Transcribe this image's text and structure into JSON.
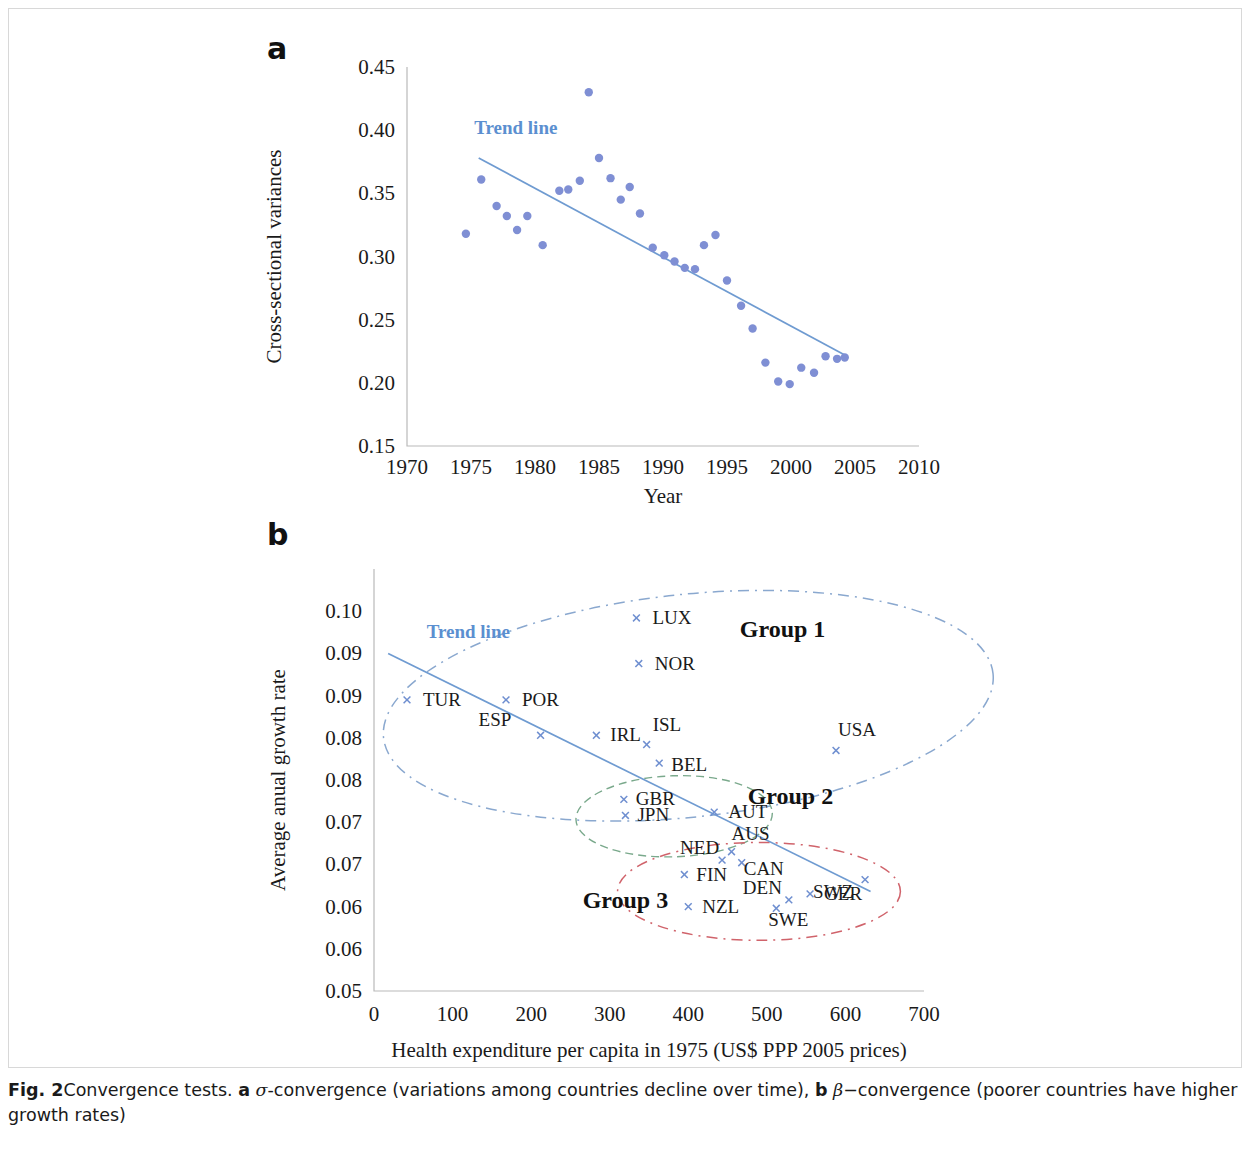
{
  "figure": {
    "panel_a_letter": "a",
    "panel_b_letter": "b",
    "caption_prefix": "Fig. 2",
    "caption_part1": "Convergence tests. ",
    "caption_a_letter": "a",
    "caption_sigma": "σ",
    "caption_part2": "-convergence (variations among countries decline over time), ",
    "caption_b_letter": "b",
    "caption_beta": "β",
    "caption_part3": "−convergence (poorer countries have higher growth rates)"
  },
  "colors": {
    "marker_blue": "#7f8fd4",
    "trend_blue": "#6f9bd1",
    "trend_label_blue": "#5b8fd0",
    "group1_ellipse": "#8aa8cf",
    "group2_ellipse": "#7aa98c",
    "group3_ellipse": "#d0636b",
    "axis_gray": "#b9b9b9"
  },
  "chart_data": [
    {
      "id": "panel_a",
      "type": "scatter",
      "title": "",
      "xlabel": "Year",
      "ylabel": "Cross-sectional variances",
      "xlim": [
        1970,
        2010
      ],
      "ylim": [
        0.15,
        0.45
      ],
      "xticks": [
        1970,
        1975,
        1980,
        1985,
        1990,
        1995,
        2000,
        2005,
        2010
      ],
      "xtick_labels": [
        "1970",
        "1975",
        "1980",
        "1985",
        "1990",
        "1995",
        "2000",
        "2005",
        "2010"
      ],
      "yticks": [
        0.15,
        0.2,
        0.25,
        0.3,
        0.35,
        0.4,
        0.45
      ],
      "ytick_labels": [
        "0.15",
        "0.20",
        "0.25",
        "0.30",
        "0.35",
        "0.40",
        "0.45"
      ],
      "grid": false,
      "legend": "none",
      "trend_label": "Trend line",
      "trendline": {
        "x": [
          1975.6,
          2004.2
        ],
        "y": [
          0.378,
          0.222
        ]
      },
      "x": [
        1974.6,
        1975.8,
        1977.0,
        1977.8,
        1978.6,
        1979.4,
        1980.6,
        1981.9,
        1982.6,
        1983.5,
        1984.2,
        1985.0,
        1985.9,
        1986.7,
        1987.4,
        1988.2,
        1989.2,
        1990.1,
        1990.9,
        1991.7,
        1992.5,
        1993.2,
        1994.1,
        1995.0,
        1996.1,
        1997.0,
        1998.0,
        1999.0,
        1999.9,
        2000.8,
        2001.8,
        2002.7,
        2003.6,
        2004.2
      ],
      "y": [
        0.318,
        0.361,
        0.34,
        0.332,
        0.321,
        0.332,
        0.309,
        0.352,
        0.353,
        0.36,
        0.43,
        0.378,
        0.362,
        0.345,
        0.355,
        0.334,
        0.307,
        0.301,
        0.296,
        0.291,
        0.29,
        0.309,
        0.317,
        0.281,
        0.261,
        0.243,
        0.216,
        0.201,
        0.199,
        0.212,
        0.208,
        0.221,
        0.219,
        0.22
      ]
    },
    {
      "id": "panel_b",
      "type": "scatter",
      "title": "",
      "xlabel": "Health expenditure per capita in 1975 (US$ PPP 2005 prices)",
      "ylabel": "Average anual growth rate",
      "xlim": [
        0,
        700
      ],
      "ylim": [
        0.05,
        0.1
      ],
      "xticks": [
        0,
        100,
        200,
        300,
        400,
        500,
        600,
        700
      ],
      "xtick_labels": [
        "0",
        "100",
        "200",
        "300",
        "400",
        "500",
        "600",
        "700"
      ],
      "yticks": [
        0.05,
        0.055,
        0.06,
        0.065,
        0.07,
        0.075,
        0.08,
        0.085,
        0.09,
        0.095,
        0.1
      ],
      "ytick_labels": [
        "0.05",
        "0.06",
        "0.06",
        "0.07",
        "0.07",
        "0.08",
        "0.08",
        "0.09",
        "0.09",
        "0.10"
      ],
      "grid": false,
      "legend": "none",
      "trend_label": "Trend line",
      "trendline": {
        "x": [
          18,
          632
        ],
        "y": [
          0.09,
          0.0618
        ]
      },
      "points": [
        {
          "code": "TUR",
          "x": 42,
          "y": 0.0845,
          "label_dx": 16,
          "label_dy": 6
        },
        {
          "code": "POR",
          "x": 168,
          "y": 0.0845,
          "label_dx": 16,
          "label_dy": 6
        },
        {
          "code": "ESP",
          "x": 212,
          "y": 0.0803,
          "label_dx": -62,
          "label_dy": -9
        },
        {
          "code": "IRL",
          "x": 283,
          "y": 0.0803,
          "label_dx": 14,
          "label_dy": 6
        },
        {
          "code": "ISL",
          "x": 347,
          "y": 0.0792,
          "label_dx": 6,
          "label_dy": -14
        },
        {
          "code": "LUX",
          "x": 334,
          "y": 0.0942,
          "label_dx": 16,
          "label_dy": 6
        },
        {
          "code": "NOR",
          "x": 337,
          "y": 0.0888,
          "label_dx": 16,
          "label_dy": 6
        },
        {
          "code": "USA",
          "x": 588,
          "y": 0.0785,
          "label_dx": 2,
          "label_dy": -14
        },
        {
          "code": "BEL",
          "x": 363,
          "y": 0.077,
          "label_dx": 12,
          "label_dy": 8
        },
        {
          "code": "GBR",
          "x": 318,
          "y": 0.0727,
          "label_dx": 12,
          "label_dy": 6
        },
        {
          "code": "JPN",
          "x": 320,
          "y": 0.0708,
          "label_dx": 12,
          "label_dy": 6
        },
        {
          "code": "AUT",
          "x": 433,
          "y": 0.0712,
          "label_dx": 14,
          "label_dy": 6
        },
        {
          "code": "AUS",
          "x": 455,
          "y": 0.0665,
          "label_dx": 0,
          "label_dy": -12
        },
        {
          "code": "NED",
          "x": 443,
          "y": 0.0655,
          "label_dx": -42,
          "label_dy": -6
        },
        {
          "code": "CAN",
          "x": 468,
          "y": 0.0652,
          "label_dx": 2,
          "label_dy": 12
        },
        {
          "code": "FIN",
          "x": 395,
          "y": 0.0638,
          "label_dx": 12,
          "label_dy": 6
        },
        {
          "code": "SWZ",
          "x": 625,
          "y": 0.0632,
          "label_dx": -52,
          "label_dy": 18
        },
        {
          "code": "DEN",
          "x": 528,
          "y": 0.0608,
          "label_dx": -46,
          "label_dy": -6
        },
        {
          "code": "GER",
          "x": 555,
          "y": 0.0615,
          "label_dx": 14,
          "label_dy": 6
        },
        {
          "code": "NZL",
          "x": 400,
          "y": 0.06,
          "label_dx": 14,
          "label_dy": 6
        },
        {
          "code": "SWE",
          "x": 512,
          "y": 0.0598,
          "label_dx": -8,
          "label_dy": 18
        }
      ],
      "groups": [
        {
          "name": "Group 1",
          "style": "blue-dashdot",
          "cx": 400,
          "cy": 0.0838,
          "rx": 390,
          "ry": 0.0132,
          "rotation": -6,
          "label_x": 520,
          "label_y": 0.092
        },
        {
          "name": "Group 2",
          "style": "green-dashed",
          "cx": 382,
          "cy": 0.0707,
          "rx": 125,
          "ry": 0.0048,
          "rotation": -2,
          "label_x": 530,
          "label_y": 0.0722
        },
        {
          "name": "Group 3",
          "style": "red-dashdot",
          "cx": 490,
          "cy": 0.0618,
          "rx": 180,
          "ry": 0.0058,
          "rotation": 0,
          "label_x": 320,
          "label_y": 0.0598
        }
      ]
    }
  ]
}
